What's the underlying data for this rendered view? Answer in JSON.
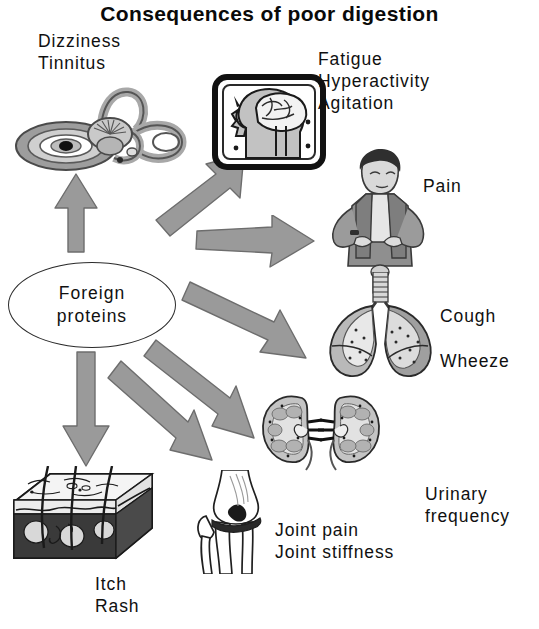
{
  "title": "Consequences of poor digestion",
  "hub": {
    "line1": "Foreign",
    "line2": "proteins"
  },
  "labels": {
    "ear": "Dizziness\nTinnitus",
    "brain": "Fatigue\nHyperactivity\nAgitation",
    "pain": "Pain",
    "lungs": "Cough",
    "lungs2": "Wheeze",
    "kidney": "Urinary\nfrequency",
    "joint": "Joint pain\nJoint stiffness",
    "skin": "Itch\nRash"
  },
  "illustrations": [
    {
      "name": "inner-ear-illustration",
      "alt": "Inner ear: cochlea and semicircular canals"
    },
    {
      "name": "brain-head-illustration",
      "alt": "Framed profile of head with brain"
    },
    {
      "name": "person-torso-illustration",
      "alt": "Person standing with hands on hips"
    },
    {
      "name": "lungs-illustration",
      "alt": "Lungs with trachea"
    },
    {
      "name": "kidneys-illustration",
      "alt": "Pair of kidney cross-sections"
    },
    {
      "name": "knee-joint-illustration",
      "alt": "Knee joint bones"
    },
    {
      "name": "skin-block-illustration",
      "alt": "Skin cross-section block with hair follicles"
    }
  ],
  "arrows": [
    {
      "name": "arrow-to-ear",
      "target": "inner ear"
    },
    {
      "name": "arrow-to-brain",
      "target": "brain"
    },
    {
      "name": "arrow-to-person",
      "target": "person"
    },
    {
      "name": "arrow-to-lungs",
      "target": "lungs"
    },
    {
      "name": "arrow-to-kidneys",
      "target": "kidneys"
    },
    {
      "name": "arrow-to-joint",
      "target": "joint"
    },
    {
      "name": "arrow-to-skin",
      "target": "skin"
    }
  ],
  "colors": {
    "arrow_fill": "#9a9a9a",
    "arrow_stroke": "#6d6d6d",
    "ink": "#101010",
    "background": "#ffffff",
    "art_mid": "#b0b0b0",
    "art_dark": "#6a6a6a"
  }
}
